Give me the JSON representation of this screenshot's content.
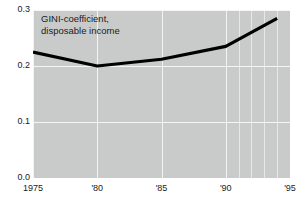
{
  "chart_data": {
    "type": "line",
    "title": "GINI-coefficient,\ndisposable income",
    "xlabel": "",
    "ylabel": "",
    "xlim": [
      1975,
      1995
    ],
    "ylim": [
      0.0,
      0.3
    ],
    "grid": true,
    "legend": "none",
    "background_color": "#c9cbca",
    "line_color": "#000000",
    "gridline_color": "#f2f3f2",
    "y_ticks": [
      "0.0",
      "0.1",
      "0.2",
      "0.3"
    ],
    "y_tick_values": [
      0.0,
      0.1,
      0.2,
      0.3
    ],
    "x_ticks": [
      "1975",
      "'80",
      "'85",
      "'90",
      "'95"
    ],
    "x_tick_values": [
      1975,
      1980,
      1985,
      1990,
      1995
    ],
    "x_major_gridlines": [
      1975,
      1980,
      1985,
      1990,
      1995
    ],
    "x_minor_gridlines": [
      1990,
      1991,
      1992,
      1993,
      1994,
      1995
    ],
    "series": [
      {
        "name": "GINI-coefficient, disposable income",
        "x": [
          1975,
          1980,
          1985,
          1990,
          1994
        ],
        "values": [
          0.225,
          0.2,
          0.212,
          0.235,
          0.285
        ]
      }
    ]
  }
}
